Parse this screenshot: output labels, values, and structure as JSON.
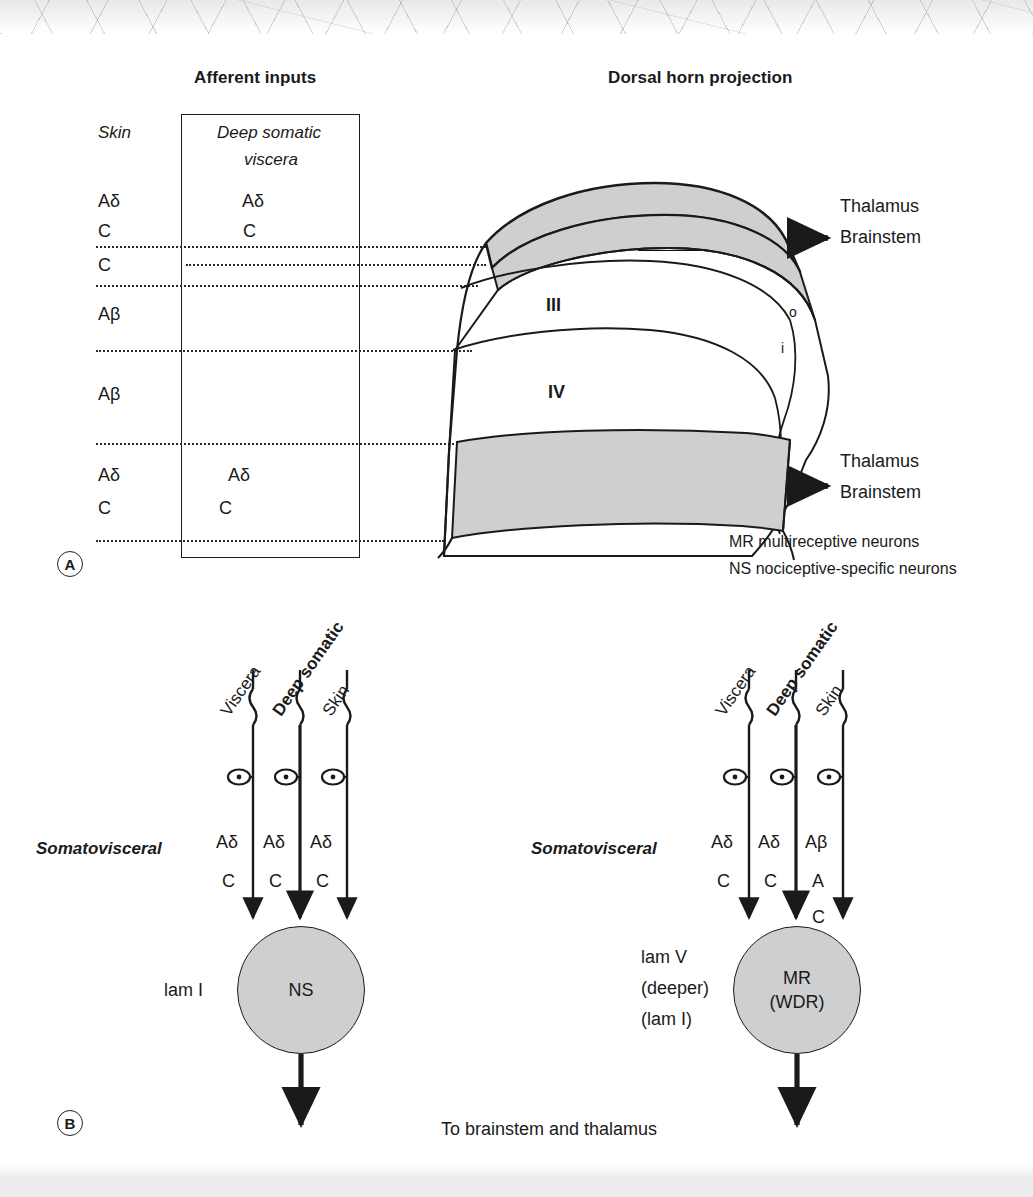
{
  "figure": {
    "panel_a_letter": "A",
    "panel_b_letter": "B"
  },
  "panel_a": {
    "headings": {
      "afferent": "Afferent inputs",
      "dorsal_horn": "Dorsal horn projection"
    },
    "skin_column": {
      "title": "Skin",
      "entries": [
        "Aδ",
        "C",
        "C",
        "Aβ",
        "Aβ",
        "Aδ",
        "C"
      ]
    },
    "deep_column": {
      "title_line1": "Deep somatic",
      "title_line2": "viscera",
      "entries": [
        "Aδ",
        "C",
        "Aδ",
        "C"
      ]
    },
    "laminae": [
      "I",
      "II",
      "III",
      "IV",
      "V"
    ],
    "marker_boxes": [
      "NS, MR",
      "NS, MR",
      "MR"
    ],
    "lamina_ii_sublayers": [
      "o",
      "i"
    ],
    "projections": [
      {
        "line1": "Thalamus",
        "line2": "Brainstem"
      },
      {
        "line1": "Thalamus",
        "line2": "Brainstem"
      }
    ],
    "legend": [
      "MR multireceptive neurons",
      "NS nociceptive-specific neurons"
    ]
  },
  "panel_b": {
    "bottom_caption": "To brainstem and thalamus",
    "neurons": [
      {
        "side_label": "Somatovisceral",
        "lamina_label_lines": [
          "lam I"
        ],
        "soma_lines": [
          "NS"
        ],
        "fibres": [
          {
            "source": "Viscera",
            "bold": false,
            "fiber_types": [
              "Aδ",
              "C"
            ]
          },
          {
            "source": "Deep somatic",
            "bold": true,
            "fiber_types": [
              "Aδ",
              "C"
            ]
          },
          {
            "source": "Skin",
            "bold": false,
            "fiber_types": [
              "Aδ",
              "C"
            ]
          }
        ]
      },
      {
        "side_label": "Somatovisceral",
        "lamina_label_lines": [
          "lam V",
          "(deeper)",
          "(lam I)"
        ],
        "soma_lines": [
          "MR",
          "(WDR)"
        ],
        "fibres": [
          {
            "source": "Viscera",
            "bold": false,
            "fiber_types": [
              "Aδ",
              "C"
            ]
          },
          {
            "source": "Deep somatic",
            "bold": true,
            "fiber_types": [
              "Aδ",
              "C"
            ]
          },
          {
            "source": "Skin",
            "bold": false,
            "fiber_types": [
              "Aβ",
              "A",
              "C"
            ]
          }
        ]
      }
    ]
  },
  "colors": {
    "ink": "#1a1a1a",
    "shaded_lamina": "#cfcfcf",
    "soma_fill": "#cfcfcf",
    "paper": "#ffffff"
  }
}
